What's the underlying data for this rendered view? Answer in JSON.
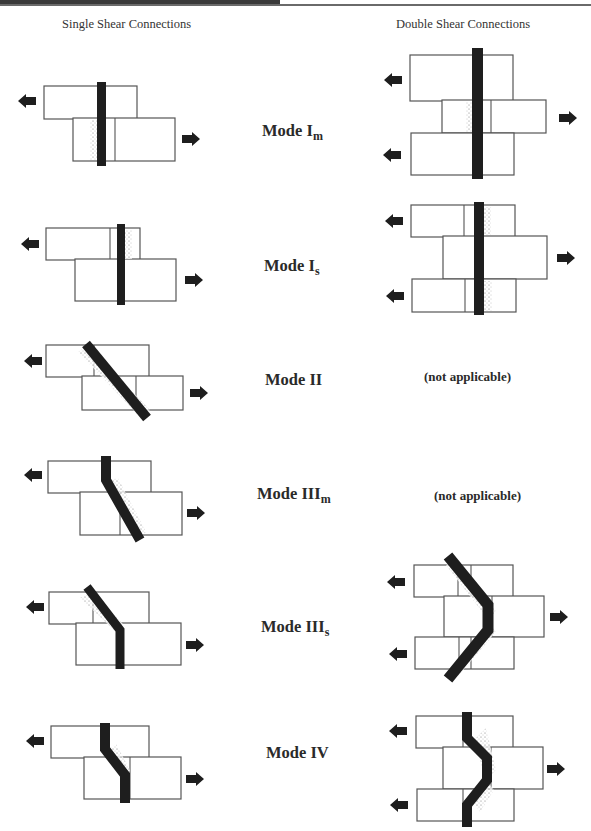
{
  "page": {
    "header_fragment": "",
    "columns": {
      "single": "Single Shear Connections",
      "double": "Double Shear Connections"
    },
    "modes": [
      {
        "id": "Im",
        "base": "Mode I",
        "sub": "m",
        "single": "diagram",
        "double": "diagram"
      },
      {
        "id": "Is",
        "base": "Mode I",
        "sub": "s",
        "single": "diagram",
        "double": "diagram"
      },
      {
        "id": "II",
        "base": "Mode II",
        "sub": "",
        "single": "diagram",
        "double": "(not applicable)"
      },
      {
        "id": "IIIm",
        "base": "Mode III",
        "sub": "m",
        "single": "diagram",
        "double": "(not applicable)"
      },
      {
        "id": "IIIs",
        "base": "Mode III",
        "sub": "s",
        "single": "diagram",
        "double": "diagram"
      },
      {
        "id": "IV",
        "base": "Mode IV",
        "sub": "",
        "single": "diagram",
        "double": "diagram"
      }
    ],
    "not_applicable": "(not applicable)",
    "colors": {
      "ink": "#1e1e1e",
      "outline": "#555555",
      "background": "#ffffff"
    }
  }
}
